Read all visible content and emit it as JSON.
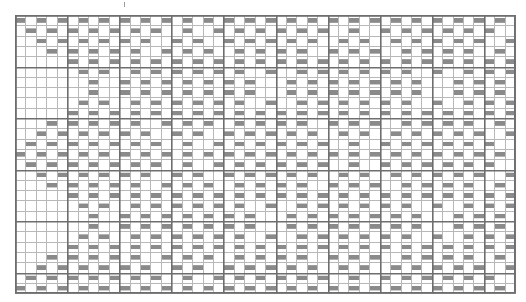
{
  "document": {
    "title": "Weaving Draft Pattern Chart",
    "type": "grid-pattern-chart",
    "description": "Monochrome grid chart of repeating diamond / lozenge motifs"
  },
  "canvas": {
    "width": 526,
    "height": 302,
    "background_color": "#ffffff"
  },
  "grid": {
    "origin_x": 14,
    "origin_y": 14,
    "columns": 48,
    "rows": 27,
    "cell_width": 10.42,
    "cell_height": 10.3,
    "minor_line_color": "#b8b8b8",
    "minor_line_width": 1,
    "major_line_color": "#6e6e6e",
    "major_line_width": 1.6,
    "major_every": 5,
    "border_color": "#6e6e6e",
    "border_width": 1.6
  },
  "marks": {
    "fill_color": "#8a8a8a",
    "fill_style": "solid-gray-block",
    "inset_y": 0.28,
    "legend_label": "filled cell = warp/weft float"
  },
  "chart_data": {
    "type": "heatmap",
    "xlabel": "",
    "ylabel": "",
    "columns": 48,
    "rows": 27,
    "value_meaning": {
      "1": "filled (gray block)",
      "0": "empty (white cell)"
    },
    "x": [
      1,
      2,
      3,
      4,
      5,
      6,
      7,
      8,
      9,
      10,
      11,
      12,
      13,
      14,
      15,
      16,
      17,
      18,
      19,
      20,
      21,
      22,
      23,
      24,
      25,
      26,
      27,
      28,
      29,
      30,
      31,
      32,
      33,
      34,
      35,
      36,
      37,
      38,
      39,
      40,
      41,
      42,
      43,
      44,
      45,
      46,
      47,
      48
    ],
    "y": [
      1,
      2,
      3,
      4,
      5,
      6,
      7,
      8,
      9,
      10,
      11,
      12,
      13,
      14,
      15,
      16,
      17,
      18,
      19,
      20,
      21,
      22,
      23,
      24,
      25,
      26,
      27
    ],
    "matrix": [
      "000000000000000000000011100000000000000000000000",
      "000000000000000000011111111100000000000000000000",
      "000000000000000001111111111111000000000000000000",
      "000000000000000111111111111111110000000000000000",
      "000000000000011111111111111111111100000000000000",
      "000000000001111111111111111111111111000000000000",
      "000000000111111111111111111111111111110000000000",
      "000000011111111111111111111111111111111100000000",
      "000001111111111111111111111111111111111111000000",
      "000111111111111111111111111111111111111111110000",
      "011111111111111111111111111111111111111111111100",
      "111111111111111111111111111111111111111111111111",
      "011111111111111111111111111111111111111111111100",
      "000111111111111111111111111111111111111111110000",
      "000001111111111111111111111111111111111111000000",
      "000000011111111111111111111111111111111100000000",
      "000000000111111111111111111111111111110000000000",
      "000000000001111111111111111111111111000000000000",
      "000000000000011111111111111111111100000000000000",
      "000000000000000111111111111111110000000000000000",
      "000000000000000001111111111111000000000000000000",
      "000000000000000000011111111100000000000000000000",
      "000000000000000000000111110000000000000000000000",
      "000000000000000000000011100000000000000000000000",
      "000000000000000000000001000000000000000000000000",
      "000000000000000000000011100000000000000000000000",
      "000000000000000000000111110000000000000000000000"
    ],
    "motif": {
      "name": "diamond-lozenge",
      "repeat_columns": 16,
      "repeat_rows": 27,
      "repeat_count_horizontal": 3,
      "offset_alternate": true
    },
    "legend": [],
    "gridlines": true,
    "colorscale": [
      "#ffffff",
      "#8a8a8a"
    ]
  },
  "tick_marker": {
    "present": true,
    "x": 124,
    "y": 2,
    "label": ""
  }
}
